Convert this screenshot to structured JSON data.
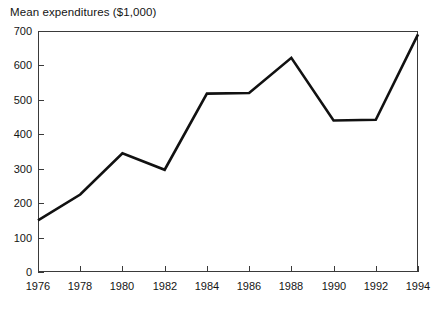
{
  "chart_data": {
    "type": "line",
    "title": "Mean expenditures ($1,000)",
    "xlabel": "",
    "ylabel": "Mean expenditures ($1,000)",
    "categories": [
      1976,
      1978,
      1980,
      1982,
      1984,
      1986,
      1988,
      1990,
      1992,
      1994
    ],
    "x": [
      1976,
      1978,
      1980,
      1982,
      1984,
      1986,
      1988,
      1990,
      1992,
      1994
    ],
    "values": [
      150,
      225,
      345,
      297,
      518,
      520,
      622,
      440,
      442,
      690
    ],
    "series": [
      {
        "name": "Mean expenditures",
        "values": [
          150,
          225,
          345,
          297,
          518,
          520,
          622,
          440,
          442,
          690
        ],
        "color": "#111111"
      }
    ],
    "xlim": [
      1976,
      1994
    ],
    "ylim": [
      0,
      700
    ],
    "ytick_values": [
      0,
      100,
      200,
      300,
      400,
      500,
      600,
      700
    ],
    "ytick_labels": [
      "0",
      "100",
      "200",
      "300",
      "400",
      "500",
      "600",
      "700"
    ],
    "xtick_values": [
      1976,
      1978,
      1980,
      1982,
      1984,
      1986,
      1988,
      1990,
      1992,
      1994
    ],
    "xtick_labels": [
      "1976",
      "1978",
      "1980",
      "1982",
      "1984",
      "1986",
      "1988",
      "1990",
      "1992",
      "1994"
    ],
    "grid": false,
    "legend": false,
    "legend_position": "none",
    "line_color": "#111111",
    "frame_color": "#3a3a3a",
    "background": "#ffffff"
  },
  "figure": {
    "axis_title": "Mean expenditures ($1,000)"
  }
}
